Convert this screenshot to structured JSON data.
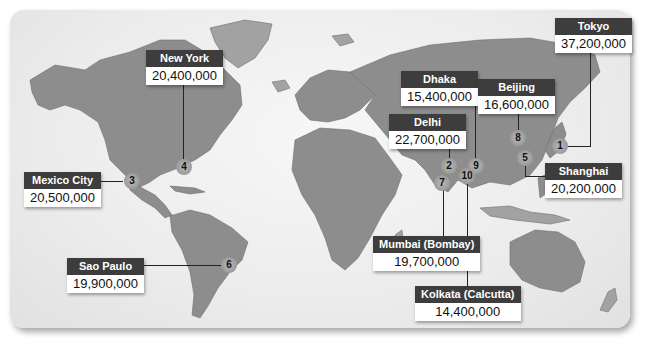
{
  "map": {
    "type": "world-map",
    "subject": "Most populous urban areas",
    "colors": {
      "land": "#8d8d8d",
      "ocean": "#ececec",
      "label_header": "#3d3d3d",
      "label_body": "#ffffff",
      "leader": "#222222"
    }
  },
  "cities": [
    {
      "rank": "1",
      "name": "Tokyo",
      "population": "37,200,000"
    },
    {
      "rank": "2",
      "name": "Delhi",
      "population": "22,700,000"
    },
    {
      "rank": "3",
      "name": "Mexico City",
      "population": "20,500,000"
    },
    {
      "rank": "4",
      "name": "New York",
      "population": "20,400,000"
    },
    {
      "rank": "5",
      "name": "Shanghai",
      "population": "20,200,000"
    },
    {
      "rank": "6",
      "name": "Sao Paulo",
      "population": "19,900,000"
    },
    {
      "rank": "7",
      "name": "Mumbai (Bombay)",
      "population": "19,700,000"
    },
    {
      "rank": "8",
      "name": "Beijing",
      "population": "16,600,000"
    },
    {
      "rank": "9",
      "name": "Dhaka",
      "population": "15,400,000"
    },
    {
      "rank": "10",
      "name": "Kolkata (Calcutta)",
      "population": "14,400,000"
    }
  ]
}
